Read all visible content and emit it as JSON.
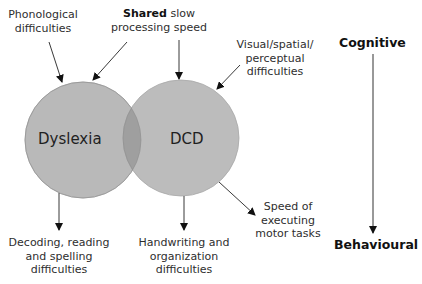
{
  "circles": {
    "left": {
      "label": "Dyslexia",
      "fill": "#b9b9b9"
    },
    "right": {
      "label": "DCD",
      "fill": "#b9b9b9"
    },
    "overlap_fill": "#9e9e9e"
  },
  "labels": {
    "phonological": {
      "line1": "Phonological",
      "line2": "difficulties"
    },
    "shared": {
      "bold": "Shared",
      "rest": " slow",
      "line2": "processing speed"
    },
    "visual": {
      "line1": "Visual/spatial/",
      "line2": "perceptual",
      "line3": "difficulties"
    },
    "decoding": {
      "line1": "Decoding, reading",
      "line2": "and spelling",
      "line3": "difficulties"
    },
    "handwriting": {
      "line1": "Handwriting and",
      "line2": "organization",
      "line3": "difficulties"
    },
    "speed": {
      "line1": "Speed of",
      "line2": "executing",
      "line3": "motor tasks"
    }
  },
  "axis": {
    "top": "Cognitive",
    "bottom": "Behavioural"
  }
}
